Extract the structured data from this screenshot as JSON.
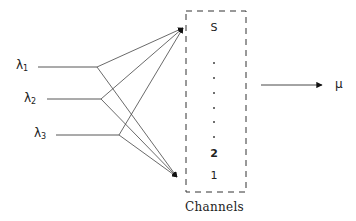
{
  "diagram": {
    "type": "queueing-system",
    "inputs": [
      {
        "symbol": "λ",
        "subscript": "1"
      },
      {
        "symbol": "λ",
        "subscript": "2"
      },
      {
        "symbol": "λ",
        "subscript": "3"
      }
    ],
    "channels": {
      "top_label": "S",
      "ellipsis_dots": 6,
      "lower_labels": [
        "2",
        "1"
      ],
      "caption": "Channels"
    },
    "output": {
      "symbol": "μ"
    },
    "colors": {
      "line": "#333333",
      "background": "#ffffff"
    }
  }
}
